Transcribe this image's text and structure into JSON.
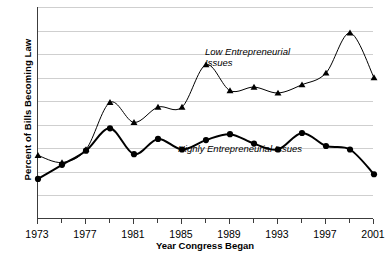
{
  "chart_data": {
    "type": "line",
    "title": "",
    "xlabel": "Year Congress Began",
    "ylabel": "Percent of Bills Becoming Law",
    "x": [
      1973,
      1975,
      1977,
      1979,
      1981,
      1983,
      1985,
      1987,
      1989,
      1991,
      1993,
      1995,
      1997,
      1999,
      2001
    ],
    "xlim": [
      1973,
      2001
    ],
    "ylim": [
      0,
      9
    ],
    "yticks": [
      0,
      1,
      2,
      3,
      4,
      5,
      6,
      7,
      8,
      9
    ],
    "xtick_labels": [
      "1973",
      "1977",
      "1981",
      "1985",
      "1989",
      "1993",
      "1997",
      "2001"
    ],
    "xtick_values": [
      1973,
      1977,
      1981,
      1985,
      1989,
      1993,
      1997,
      2001
    ],
    "grid": "horizontal",
    "legend_position": "inline-annotation",
    "series": [
      {
        "name": "Low Entrepreneurial Issues",
        "marker": "triangle",
        "color": "#000000",
        "line_width": 1,
        "values": [
          2.7,
          2.4,
          2.95,
          4.95,
          4.1,
          4.75,
          4.75,
          6.55,
          5.45,
          5.6,
          5.35,
          5.7,
          6.2,
          7.9,
          6.0
        ]
      },
      {
        "name": "Highly Entrepreneurial Issues",
        "marker": "circle",
        "color": "#000000",
        "line_width": 2,
        "values": [
          1.7,
          2.3,
          2.9,
          3.85,
          2.75,
          3.4,
          2.95,
          3.35,
          3.6,
          3.2,
          2.95,
          3.65,
          3.1,
          2.95,
          1.9
        ]
      }
    ],
    "annotations": [
      {
        "text_line1": "Low Entrepreneurial",
        "text_line2": "Issues"
      },
      {
        "text": "Highly Entrepreneurial Issues"
      }
    ]
  },
  "labels": {
    "y_axis_title": "Percent of Bills Becoming Law",
    "x_axis_title": "Year Congress Began",
    "annot_low_line1": "Low Entrepreneurial",
    "annot_low_line2": "Issues",
    "annot_high": "Highly Entrepreneurial Issues"
  }
}
